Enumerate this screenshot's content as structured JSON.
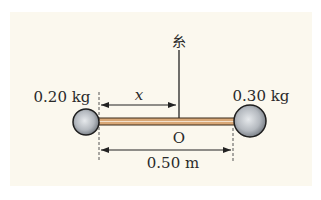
{
  "diagram": {
    "string_label": "糸",
    "left_mass_label": "0.20 kg",
    "right_mass_label": "0.30 kg",
    "distance_label": "x",
    "pivot_label": "O",
    "rod_length_label": "0.50 m",
    "colors": {
      "background": "#fbf8ee",
      "rod": "#d9a877",
      "ball": "#b9bec4",
      "line": "#222222"
    }
  }
}
